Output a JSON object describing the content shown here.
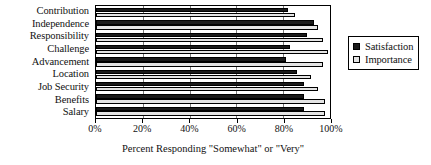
{
  "chart_data": {
    "type": "bar",
    "orientation": "horizontal",
    "title": "",
    "xlabel": "Percent Responding \"Somewhat\" or \"Very\"",
    "ylabel": "",
    "xlim": [
      0,
      100
    ],
    "xticks": [
      0,
      20,
      40,
      60,
      80,
      100
    ],
    "xtick_labels": [
      "0%",
      "20%",
      "40%",
      "60%",
      "80%",
      "100%"
    ],
    "grid": true,
    "grid_axis": "x",
    "legend_position": "right",
    "categories": [
      "Contribution",
      "Independence",
      "Responsibility",
      "Challenge",
      "Advancement",
      "Location",
      "Job Security",
      "Benefits",
      "Salary"
    ],
    "series": [
      {
        "name": "Satisfaction",
        "color": "#1a1a1a",
        "values": [
          82,
          93,
          90,
          83,
          81,
          86,
          89,
          89,
          89
        ]
      },
      {
        "name": "Importance",
        "color": "#e4e4e4",
        "values": [
          85,
          95,
          97,
          99,
          97,
          92,
          95,
          98,
          98
        ]
      }
    ]
  },
  "legend": {
    "items": [
      {
        "label": "Satisfaction"
      },
      {
        "label": "Importance"
      }
    ]
  }
}
